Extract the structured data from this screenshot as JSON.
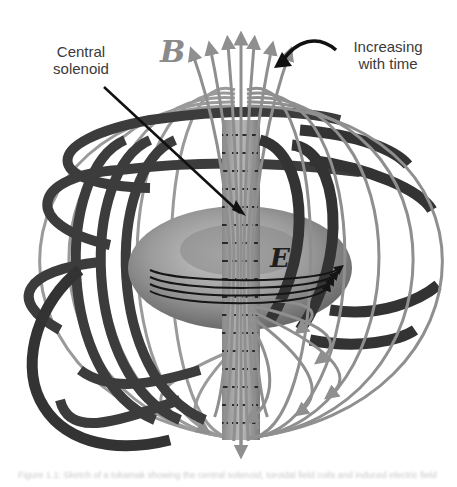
{
  "figure": {
    "labels": {
      "central_solenoid": "Central solenoid",
      "increasing_with_time": "Increasing with time",
      "magnetic_field_symbol": "B",
      "electric_field_symbol": "E"
    },
    "caption": "Figure 1.1: Sketch of a tokamak showing the central solenoid, toroidal field coils and induced electric field",
    "colors": {
      "field_lines": "#8f8f8f",
      "coils": "#3c3c3c",
      "plasma_torus": "#9a9a9a",
      "solenoid": "#a8a8a8",
      "electric_loops": "#151515",
      "annotation_arrow": "#111111",
      "label_text": "#3a3a3a"
    }
  }
}
